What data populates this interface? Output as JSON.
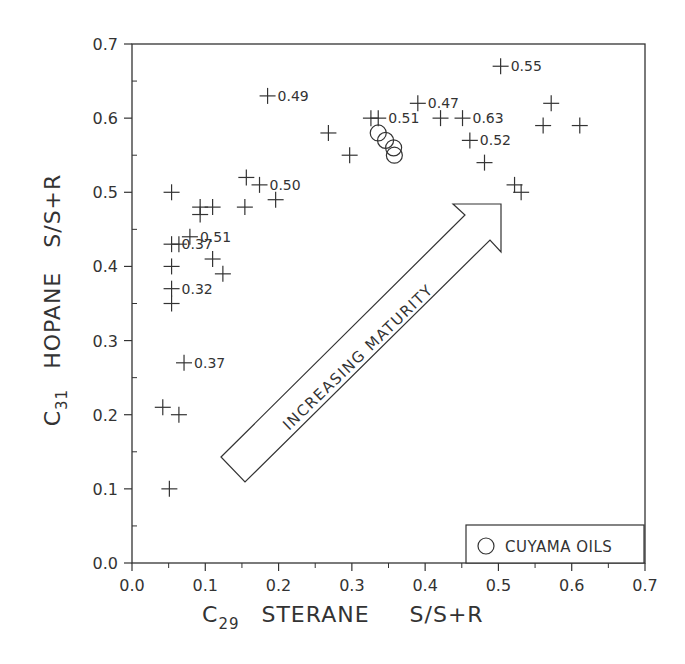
{
  "chart_data": {
    "type": "scatter",
    "title": "",
    "xlabel": "C29 STERANE S/S+R",
    "ylabel": "C31 HOPANE S/S+R",
    "xlabel_parts": {
      "prefix": "C",
      "sub": "29",
      "main": "STERANE",
      "suffix": "S/S+R"
    },
    "ylabel_parts": {
      "prefix": "C",
      "sub": "31",
      "main": "HOPANE",
      "suffix": "S/S+R"
    },
    "xlim": [
      0.0,
      0.7
    ],
    "ylim": [
      0.0,
      0.7
    ],
    "xticks": [
      "0.0",
      "0.1",
      "0.2",
      "0.3",
      "0.4",
      "0.5",
      "0.6",
      "0.7"
    ],
    "yticks": [
      "0.0",
      "0.1",
      "0.2",
      "0.3",
      "0.4",
      "0.5",
      "0.6",
      "0.7"
    ],
    "grid": false,
    "annotation": "INCREASING MATURITY",
    "legend": {
      "position": "lower right",
      "entries": [
        {
          "marker": "circle",
          "label": "CUYAMA OILS"
        }
      ]
    },
    "series": [
      {
        "name": "Samples",
        "marker": "plus",
        "points": [
          {
            "x": 0.051,
            "y": 0.1
          },
          {
            "x": 0.042,
            "y": 0.21
          },
          {
            "x": 0.064,
            "y": 0.2
          },
          {
            "x": 0.071,
            "y": 0.27,
            "label": "0.37"
          },
          {
            "x": 0.054,
            "y": 0.35
          },
          {
            "x": 0.054,
            "y": 0.37,
            "label": "0.32"
          },
          {
            "x": 0.054,
            "y": 0.4
          },
          {
            "x": 0.124,
            "y": 0.39
          },
          {
            "x": 0.11,
            "y": 0.41
          },
          {
            "x": 0.054,
            "y": 0.43,
            "label": "0.37"
          },
          {
            "x": 0.064,
            "y": 0.43
          },
          {
            "x": 0.079,
            "y": 0.44,
            "label": "0.51"
          },
          {
            "x": 0.093,
            "y": 0.47
          },
          {
            "x": 0.093,
            "y": 0.48
          },
          {
            "x": 0.11,
            "y": 0.48
          },
          {
            "x": 0.154,
            "y": 0.48
          },
          {
            "x": 0.054,
            "y": 0.5
          },
          {
            "x": 0.156,
            "y": 0.52
          },
          {
            "x": 0.174,
            "y": 0.51,
            "label": "0.50"
          },
          {
            "x": 0.196,
            "y": 0.49
          },
          {
            "x": 0.185,
            "y": 0.63,
            "label": "0.49"
          },
          {
            "x": 0.268,
            "y": 0.58
          },
          {
            "x": 0.297,
            "y": 0.55
          },
          {
            "x": 0.326,
            "y": 0.6
          },
          {
            "x": 0.336,
            "y": 0.6,
            "label": "0.51"
          },
          {
            "x": 0.39,
            "y": 0.62,
            "label": "0.47"
          },
          {
            "x": 0.421,
            "y": 0.6
          },
          {
            "x": 0.451,
            "y": 0.6,
            "label": "0.63"
          },
          {
            "x": 0.461,
            "y": 0.57,
            "label": "0.52"
          },
          {
            "x": 0.481,
            "y": 0.54
          },
          {
            "x": 0.503,
            "y": 0.67,
            "label": "0.55"
          },
          {
            "x": 0.522,
            "y": 0.51
          },
          {
            "x": 0.531,
            "y": 0.5
          },
          {
            "x": 0.572,
            "y": 0.62
          },
          {
            "x": 0.561,
            "y": 0.59
          },
          {
            "x": 0.611,
            "y": 0.59
          }
        ]
      },
      {
        "name": "CUYAMA OILS",
        "marker": "circle",
        "points": [
          {
            "x": 0.336,
            "y": 0.58
          },
          {
            "x": 0.346,
            "y": 0.57
          },
          {
            "x": 0.357,
            "y": 0.56
          },
          {
            "x": 0.358,
            "y": 0.55
          }
        ]
      }
    ]
  }
}
